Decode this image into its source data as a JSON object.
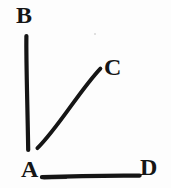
{
  "figure": {
    "type": "geometry-diagram",
    "background_color": "#fdfdfd",
    "ink_color": "#151515",
    "width": 171,
    "height": 188,
    "labels": {
      "b": "B",
      "c": "C",
      "a": "A",
      "d": "D"
    },
    "points": {
      "A": {
        "x": 34,
        "y": 171
      },
      "B": {
        "x": 26,
        "y": 35
      },
      "C": {
        "x": 101,
        "y": 68
      },
      "D": {
        "x": 141,
        "y": 176
      }
    },
    "segments": [
      {
        "name": "segment-AB",
        "from": "A",
        "to": "B",
        "x1": 26.5,
        "y1": 36,
        "x2": 28.5,
        "y2": 150,
        "width": 4.2
      },
      {
        "name": "segment-AC",
        "from": "A",
        "to": "C",
        "x1": 37.5,
        "y1": 148,
        "x2": 100.5,
        "y2": 68.5,
        "width": 4.0
      },
      {
        "name": "segment-AD",
        "from": "A",
        "to": "D",
        "x1": 42,
        "y1": 176.5,
        "x2": 140,
        "y2": 175.5,
        "width": 4.4
      }
    ],
    "speck": {
      "x": 94,
      "y": 33
    }
  }
}
